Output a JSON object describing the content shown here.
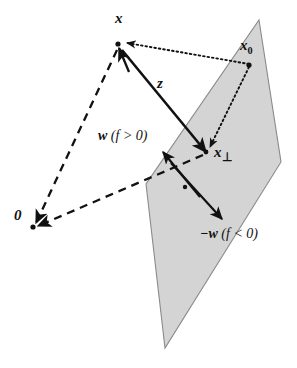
{
  "figure": {
    "background_color": "#ffffff",
    "stroke_color": "#111111",
    "plane_fill_color": "#d4d4d4",
    "plane_edge_color": "#8a8a8a"
  },
  "labels": {
    "x": "x",
    "x0": "x",
    "x0_sub": "0",
    "z": "z",
    "x_perp": "x",
    "x_perp_sub": "⊥",
    "w_positive_vec": "w",
    "w_positive_cond": "(f > 0)",
    "w_negative_vec": "−w",
    "w_negative_cond": "(f < 0)",
    "origin": "0"
  },
  "points": {
    "x": {
      "name": "x",
      "cx": 118,
      "cy": 44,
      "label_text": "x"
    },
    "x0": {
      "name": "x0",
      "cx": 249,
      "cy": 65,
      "label_text": "x0"
    },
    "x_perp": {
      "name": "x-perp",
      "cx": 206,
      "cy": 152,
      "label_text": "x⊥"
    },
    "origin": {
      "name": "origin",
      "cx": 33,
      "cy": 227,
      "label_text": "0"
    },
    "w_dot": {
      "name": "w-axis-dot",
      "cx": 185,
      "cy": 187,
      "label_text": ""
    }
  },
  "plane": {
    "name": "decision-hyperplane",
    "vertices": "259,20 281,162 165,348 146,184",
    "fill": "#d4d4d4",
    "stroke": "#8a8a8a"
  },
  "vectors": {
    "z": {
      "name": "z-vector",
      "style": "solid",
      "from": {
        "x": 122,
        "y": 50
      },
      "to": {
        "x": 204,
        "y": 151
      },
      "label": "z"
    },
    "origin_to_x": {
      "name": "origin-to-x-vector",
      "style": "dashed",
      "from": {
        "x": 117,
        "y": 50
      },
      "to": {
        "x": 35,
        "y": 224
      },
      "label": ""
    },
    "origin_to_xperp": {
      "name": "origin-to-xperp-vector",
      "style": "dashed",
      "from": {
        "x": 202,
        "y": 154
      },
      "to": {
        "x": 36,
        "y": 226
      },
      "label": ""
    },
    "w_positive": {
      "name": "w-normal-positive",
      "style": "solid",
      "from": {
        "x": 200,
        "y": 197
      },
      "to": {
        "x": 163,
        "y": 153
      },
      "label": "w (f > 0)"
    },
    "w_negative": {
      "name": "w-normal-negative",
      "style": "solid",
      "from": {
        "x": 171,
        "y": 163
      },
      "to": {
        "x": 222,
        "y": 219
      },
      "label": "−w (f < 0)"
    },
    "x_to_x0": {
      "name": "x-to-x0-dotted",
      "style": "dotted",
      "from": {
        "x": 249,
        "y": 64
      },
      "to": {
        "x": 124,
        "y": 43
      },
      "label": ""
    },
    "x0_to_xperp": {
      "name": "x0-to-xperp-dotted",
      "style": "dotted",
      "from": {
        "x": 249,
        "y": 67
      },
      "to": {
        "x": 209,
        "y": 148
      },
      "label": ""
    }
  }
}
